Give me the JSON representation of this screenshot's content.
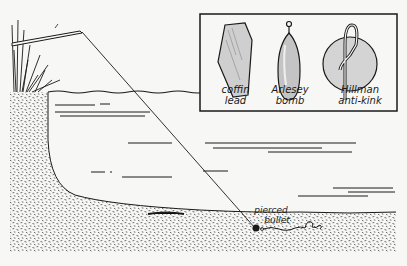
{
  "figure": {
    "inset": {
      "items": [
        {
          "label_line1": "coffin",
          "label_line2": "lead"
        },
        {
          "label_line1": "Arlesey",
          "label_line2": "bomb"
        },
        {
          "label_line1": "Hillman",
          "label_line2": "anti-kink"
        }
      ]
    },
    "callouts": {
      "bullet": {
        "line1": "pierced",
        "line2": "bullet"
      }
    },
    "colors": {
      "ink": "#1a1a1a",
      "paper": "#f7f7f5"
    }
  }
}
